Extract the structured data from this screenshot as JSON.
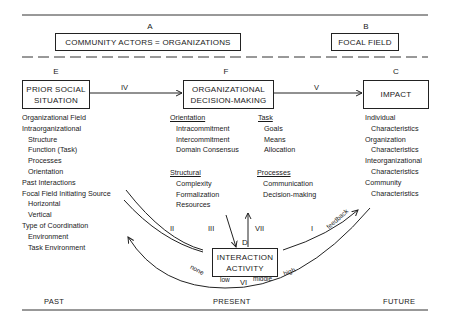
{
  "top": {
    "A": {
      "letter": "A",
      "label": "COMMUNITY ACTORS = ORGANIZATIONS"
    },
    "B": {
      "letter": "B",
      "label": "FOCAL FIELD"
    }
  },
  "boxes": {
    "E": {
      "letter": "E",
      "line1": "PRIOR SOCIAL",
      "line2": "SITUATION"
    },
    "F": {
      "letter": "F",
      "line1": "ORGANIZATIONAL",
      "line2": "DECISION-MAKING"
    },
    "C": {
      "letter": "C",
      "label": "IMPACT"
    },
    "D": {
      "letter": "D",
      "line1": "INTERACTION",
      "line2": "ACTIVITY"
    }
  },
  "arrows": {
    "IV": "IV",
    "V": "V",
    "I": "I",
    "II": "II",
    "III": "III",
    "VI": "VI",
    "VII": "VII",
    "feedback": "feedback"
  },
  "scale": {
    "none": "none",
    "low": "low",
    "middle": "middle",
    "high": "high"
  },
  "prior_situation_list": [
    "Organizational Field",
    "Intraorganizational",
    "Structure",
    "Function (Task)",
    "Processes",
    "Orientation",
    "Past Interactions",
    "Focal Field Initiating Source",
    "Horizontal",
    "Vertical",
    "Type of Coordination",
    "Environment",
    "Task Environment"
  ],
  "decision_making": {
    "orientation": {
      "heading": "Orientation",
      "items": [
        "Intracommitment",
        "Intercommitment",
        "Domain Consensus"
      ]
    },
    "task": {
      "heading": "Task",
      "items": [
        "Goals",
        "Means",
        "Allocation"
      ]
    },
    "structural": {
      "heading": "Structural",
      "items": [
        "Complexity",
        "Formalization",
        "Resources"
      ]
    },
    "processes": {
      "heading": "Processes",
      "items": [
        "Communication",
        "Decision-making"
      ]
    }
  },
  "impact_list": [
    "Individual",
    "Characteristics",
    "Organization",
    "Characteristics",
    "Inteorganizational",
    "Characteristics",
    "Community",
    "Characteristics"
  ],
  "timeline": {
    "past": "PAST",
    "present": "PRESENT",
    "future": "FUTURE"
  }
}
